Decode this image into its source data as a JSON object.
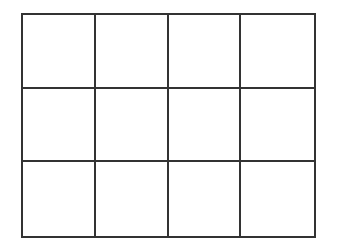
{
  "diagram": {
    "type": "grid",
    "rows": 3,
    "columns": 4,
    "line_color": "#333333",
    "background_color": "#ffffff",
    "cells": [
      [
        "",
        "",
        "",
        ""
      ],
      [
        "",
        "",
        "",
        ""
      ],
      [
        "",
        "",
        "",
        ""
      ]
    ]
  }
}
